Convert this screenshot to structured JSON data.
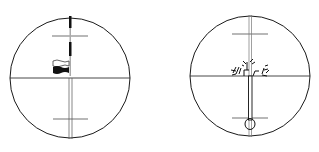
{
  "figure": {
    "colors": {
      "line": "#1a1a1a",
      "background": "#ffffff",
      "grey": "#9a9a9a"
    }
  },
  "left_view": {
    "label": "Reticle view with staff and flag target",
    "circle": {
      "cx": 70,
      "cy": 78,
      "r": 60
    },
    "stadia_upper_y": 36,
    "stadia_lower_y": 119,
    "target": "flag"
  },
  "right_view": {
    "label": "Reticle view with staff top and foliage",
    "circle": {
      "cx": 250,
      "cy": 76,
      "r": 60
    },
    "stadia_upper_y": 34,
    "stadia_lower_y": 118,
    "target": "plumb-staff"
  }
}
